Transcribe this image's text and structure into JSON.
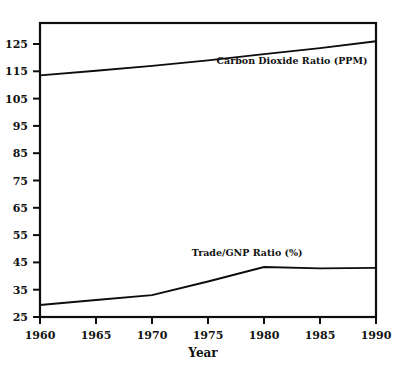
{
  "chart_data": {
    "type": "line",
    "title": "",
    "xlabel": "Year",
    "ylabel": "",
    "x": [
      1960,
      1965,
      1970,
      1975,
      1980,
      1985,
      1990
    ],
    "xlim": [
      1960,
      1990
    ],
    "ylim": [
      25,
      130
    ],
    "grid": false,
    "legend_position": "inline-annotation",
    "y_ticks": [
      25,
      35,
      45,
      55,
      65,
      75,
      85,
      95,
      105,
      115,
      125
    ],
    "y_tick_labels": [
      "25",
      "35",
      "45",
      "55",
      "65",
      "75",
      "85",
      "95",
      "105",
      "115",
      "125"
    ],
    "x_ticks": [
      1960,
      1965,
      1970,
      1975,
      1980,
      1985,
      1990
    ],
    "x_tick_labels": [
      "1960",
      "1965",
      "1970",
      "1975",
      "1980",
      "1985",
      "1990"
    ],
    "series": [
      {
        "name": "Carbon Dioxide Ratio (PPM)",
        "label": "Carbon Dioxide Ratio (PPM)",
        "x": [
          1960,
          1965,
          1970,
          1975,
          1980,
          1985,
          1990
        ],
        "values": [
          113.5,
          115.2,
          117.0,
          119.0,
          121.3,
          123.5,
          126.0
        ]
      },
      {
        "name": "Trade/GNP Ratio (%)",
        "label": "Trade/GNP Ratio (%)",
        "x": [
          1960,
          1965,
          1970,
          1975,
          1980,
          1985,
          1990
        ],
        "values": [
          29.4,
          31.2,
          33.0,
          38.0,
          43.3,
          42.8,
          43.0
        ]
      }
    ],
    "annotations": [
      {
        "text": "Carbon Dioxide Ratio (PPM)",
        "x": 1982.5,
        "y": 117.5
      },
      {
        "text": "Trade/GNP Ratio (%)",
        "x": 1978.5,
        "y": 47.5
      }
    ]
  },
  "axis": {
    "x_title": "Year"
  }
}
